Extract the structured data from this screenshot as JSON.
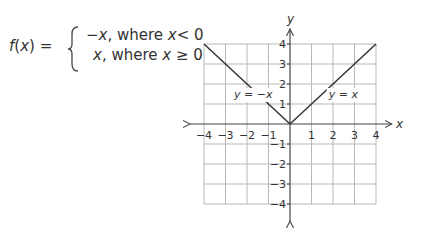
{
  "formula": {
    "lhs_func": "f",
    "lhs_var": "x",
    "lhs_suffix": " =",
    "case1_expr": "−x",
    "case1_cond_pre": ", where ",
    "case1_var": "x",
    "case1_cond_post": "< 0",
    "case2_expr": "x",
    "case2_cond_pre": ", where ",
    "case2_var": "x",
    "case2_cond_post": " ≥ 0"
  },
  "chart_data": {
    "type": "line",
    "title": "",
    "xlabel": "x",
    "ylabel": "y",
    "xlim": [
      -4,
      4
    ],
    "ylim": [
      -4,
      4
    ],
    "grid": true,
    "x_ticks": [
      -4,
      -3,
      -2,
      -1,
      1,
      2,
      3,
      4
    ],
    "y_ticks": [
      4,
      3,
      2,
      1,
      -1,
      -2,
      -3,
      -4
    ],
    "x_tick_labels": [
      "−4",
      "−3",
      "−2",
      "−1",
      "1",
      "2",
      "3",
      "4"
    ],
    "y_tick_labels": [
      "4",
      "3",
      "2",
      "1",
      "−1",
      "−2",
      "−3",
      "−4"
    ],
    "series": [
      {
        "name": "y = −x",
        "x": [
          -4,
          0
        ],
        "y": [
          4,
          0
        ]
      },
      {
        "name": "y = x",
        "x": [
          0,
          4
        ],
        "y": [
          0,
          4
        ]
      }
    ],
    "annotations": [
      {
        "text": "y = −x",
        "x": -2.6,
        "y": 1.5
      },
      {
        "text": "y = x",
        "x": 1.8,
        "y": 1.5
      }
    ],
    "colors": {
      "grid": "#b8b8b8",
      "axis": "#444444",
      "line": "#333333"
    }
  }
}
